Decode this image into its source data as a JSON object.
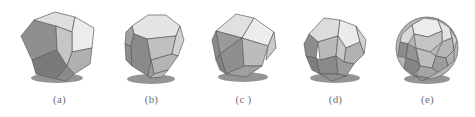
{
  "figure": {
    "background_color": "#ffffff",
    "caption_color": "#6f6f6f",
    "panel_count": 5
  },
  "palette": {
    "highlight": "#ececec",
    "light": "#dcdcdc",
    "mid_light": "#cfcfcf",
    "mid": "#bdbdbd",
    "mid_dark": "#a8a8a8",
    "dark": "#8f8f8f",
    "darker": "#7a7a7a",
    "edge": "#5d5d5d",
    "shadow": "#3d3d3d"
  },
  "panels": [
    {
      "id": "panel-a",
      "caption": "(a)",
      "shape_name": "dodecahedron",
      "x": 12
    },
    {
      "id": "panel-b",
      "caption": "(b)",
      "shape_name": "truncated-octahedron",
      "x": 104
    },
    {
      "id": "panel-c",
      "caption": "(c )",
      "shape_name": "cuboctahedron",
      "x": 196
    },
    {
      "id": "panel-d",
      "caption": "(d)",
      "shape_name": "icosidodecahedron",
      "x": 288
    },
    {
      "id": "panel-e",
      "caption": "(e)",
      "shape_name": "truncated-icosahedron",
      "x": 380
    }
  ]
}
